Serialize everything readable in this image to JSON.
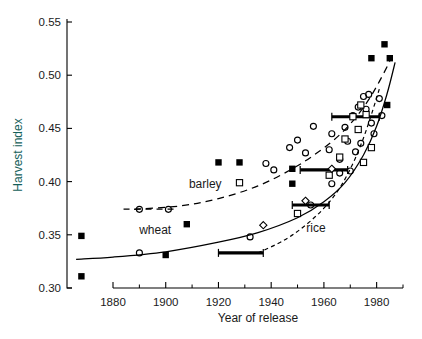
{
  "chart_data": {
    "type": "scatter",
    "title": "",
    "xlabel": "Year of release",
    "ylabel": "Harvest index",
    "xlim": [
      1865,
      1992
    ],
    "ylim": [
      0.3,
      0.55
    ],
    "grid": false,
    "legend_position": "inline-annotations",
    "x_ticks_major": [
      1880,
      1900,
      1920,
      1940,
      1960,
      1980
    ],
    "x_ticks_minor": [
      1890,
      1910,
      1930,
      1950,
      1970,
      1990
    ],
    "y_ticks": [
      0.3,
      0.35,
      0.4,
      0.45,
      0.5,
      0.55
    ],
    "y_tick_labels": [
      "0.30",
      "0.35",
      "0.40",
      "0.45",
      "0.50",
      "0.55"
    ],
    "x_tick_labels": [
      "1880",
      "1900",
      "1920",
      "1940",
      "1960",
      "1980"
    ],
    "annotations": [
      {
        "text": "barley",
        "x": 1915,
        "y": 0.394
      },
      {
        "text": "wheat",
        "x": 1896,
        "y": 0.351
      },
      {
        "text": "rice",
        "x": 1957,
        "y": 0.353
      }
    ],
    "series": [
      {
        "name": "wheat",
        "curve_style": "solid",
        "marker": "filled-square",
        "points": [
          {
            "x": 1868,
            "y": 0.349
          },
          {
            "x": 1868,
            "y": 0.311
          },
          {
            "x": 1900,
            "y": 0.331
          },
          {
            "x": 1908,
            "y": 0.36
          },
          {
            "x": 1920,
            "y": 0.418
          },
          {
            "x": 1928,
            "y": 0.418
          },
          {
            "x": 1948,
            "y": 0.412
          },
          {
            "x": 1948,
            "y": 0.398
          },
          {
            "x": 1978,
            "y": 0.516
          },
          {
            "x": 1983,
            "y": 0.529
          },
          {
            "x": 1985,
            "y": 0.516
          },
          {
            "x": 1984,
            "y": 0.472
          }
        ]
      },
      {
        "name": "wheat-open",
        "curve_style": "solid",
        "marker": "open-circle",
        "points": [
          {
            "x": 1890,
            "y": 0.333
          },
          {
            "x": 1932,
            "y": 0.348
          },
          {
            "x": 1955,
            "y": 0.378
          },
          {
            "x": 1963,
            "y": 0.398
          }
        ]
      },
      {
        "name": "barley",
        "curve_style": "dashed",
        "marker": "open-circle",
        "points": [
          {
            "x": 1890,
            "y": 0.374
          },
          {
            "x": 1901,
            "y": 0.374
          },
          {
            "x": 1938,
            "y": 0.417
          },
          {
            "x": 1941,
            "y": 0.411
          },
          {
            "x": 1947,
            "y": 0.432
          },
          {
            "x": 1950,
            "y": 0.439
          },
          {
            "x": 1956,
            "y": 0.452
          },
          {
            "x": 1953,
            "y": 0.427
          },
          {
            "x": 1962,
            "y": 0.43
          },
          {
            "x": 1963,
            "y": 0.445
          },
          {
            "x": 1966,
            "y": 0.421
          },
          {
            "x": 1968,
            "y": 0.451
          },
          {
            "x": 1969,
            "y": 0.438
          },
          {
            "x": 1971,
            "y": 0.462
          },
          {
            "x": 1972,
            "y": 0.428
          },
          {
            "x": 1973,
            "y": 0.47
          },
          {
            "x": 1975,
            "y": 0.48
          },
          {
            "x": 1976,
            "y": 0.468
          },
          {
            "x": 1977,
            "y": 0.482
          },
          {
            "x": 1978,
            "y": 0.455
          },
          {
            "x": 1979,
            "y": 0.445
          },
          {
            "x": 1981,
            "y": 0.478
          },
          {
            "x": 1982,
            "y": 0.462
          },
          {
            "x": 1974,
            "y": 0.436
          },
          {
            "x": 1970,
            "y": 0.41
          },
          {
            "x": 1966,
            "y": 0.408
          }
        ]
      },
      {
        "name": "rice",
        "curve_style": "dotted",
        "marker": "open-square",
        "points": [
          {
            "x": 1928,
            "y": 0.399
          },
          {
            "x": 1950,
            "y": 0.37
          },
          {
            "x": 1962,
            "y": 0.406
          },
          {
            "x": 1968,
            "y": 0.44
          },
          {
            "x": 1971,
            "y": 0.461
          },
          {
            "x": 1973,
            "y": 0.449
          },
          {
            "x": 1974,
            "y": 0.472
          },
          {
            "x": 1976,
            "y": 0.463
          },
          {
            "x": 1978,
            "y": 0.432
          },
          {
            "x": 1966,
            "y": 0.423
          },
          {
            "x": 1975,
            "y": 0.418
          }
        ]
      },
      {
        "name": "rice-diamond",
        "curve_style": "dotted",
        "marker": "open-diamond",
        "points": [
          {
            "x": 1937,
            "y": 0.359
          },
          {
            "x": 1953,
            "y": 0.382
          },
          {
            "x": 1963,
            "y": 0.412
          }
        ]
      }
    ],
    "range_bars": [
      {
        "x_start": 1920,
        "x_end": 1937,
        "y": 0.333
      },
      {
        "x_start": 1948,
        "x_end": 1962,
        "y": 0.378
      },
      {
        "x_start": 1951,
        "x_end": 1969,
        "y": 0.411
      },
      {
        "x_start": 1963,
        "x_end": 1981,
        "y": 0.461
      }
    ],
    "trend_curves": [
      {
        "name": "wheat",
        "style": "solid",
        "path": [
          [
            1866,
            0.327
          ],
          [
            1880,
            0.329
          ],
          [
            1900,
            0.334
          ],
          [
            1920,
            0.343
          ],
          [
            1935,
            0.352
          ],
          [
            1950,
            0.366
          ],
          [
            1960,
            0.381
          ],
          [
            1968,
            0.399
          ],
          [
            1975,
            0.425
          ],
          [
            1980,
            0.452
          ],
          [
            1984,
            0.483
          ],
          [
            1987,
            0.512
          ]
        ]
      },
      {
        "name": "barley",
        "style": "dashed",
        "path": [
          [
            1888,
            0.374
          ],
          [
            1905,
            0.377
          ],
          [
            1920,
            0.384
          ],
          [
            1935,
            0.396
          ],
          [
            1948,
            0.412
          ],
          [
            1958,
            0.428
          ],
          [
            1966,
            0.444
          ],
          [
            1972,
            0.46
          ],
          [
            1977,
            0.477
          ],
          [
            1981,
            0.494
          ],
          [
            1985,
            0.513
          ]
        ]
      },
      {
        "name": "rice",
        "style": "dotted",
        "path": [
          [
            1935,
            0.333
          ],
          [
            1945,
            0.345
          ],
          [
            1953,
            0.359
          ],
          [
            1960,
            0.375
          ],
          [
            1966,
            0.394
          ],
          [
            1971,
            0.417
          ],
          [
            1975,
            0.441
          ],
          [
            1978,
            0.463
          ],
          [
            1981,
            0.487
          ]
        ]
      }
    ]
  },
  "axes": {
    "y_title": "Harvest index",
    "x_title": "Year of release"
  }
}
